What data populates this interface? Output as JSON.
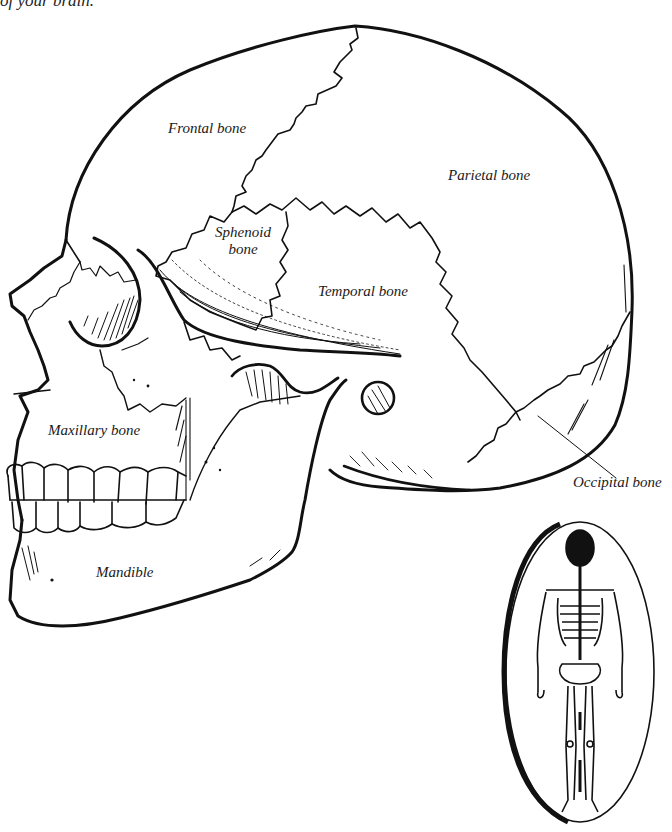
{
  "caption": {
    "text": "of your brain."
  },
  "diagram": {
    "stroke_color": "#111111",
    "background": "#ffffff",
    "labels": [
      {
        "id": "frontal",
        "text": "Frontal bone"
      },
      {
        "id": "parietal",
        "text": "Parietal bone"
      },
      {
        "id": "sphenoid_line1",
        "text": "Sphenoid"
      },
      {
        "id": "sphenoid_line2",
        "text": "bone"
      },
      {
        "id": "temporal",
        "text": "Temporal bone"
      },
      {
        "id": "maxillary",
        "text": "Maxillary bone"
      },
      {
        "id": "occipital",
        "text": "Occipital bone"
      },
      {
        "id": "mandible",
        "text": "Mandible"
      }
    ],
    "inset": {
      "description": "Full-body skeleton in oval with skull highlighted"
    }
  }
}
